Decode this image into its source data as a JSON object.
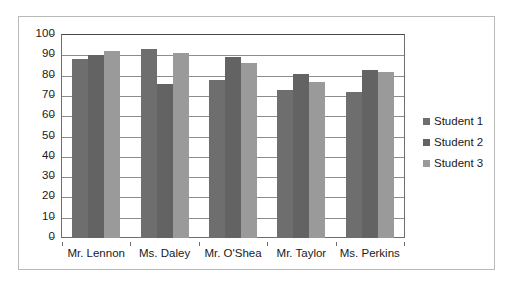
{
  "chart_data": {
    "type": "bar",
    "title": "",
    "subtitle": "",
    "xlabel": "",
    "ylabel": "",
    "categories": [
      "Mr. Lennon",
      "Ms. Daley",
      "Mr. O'Shea",
      "Mr. Taylor",
      "Ms. Perkins"
    ],
    "series": [
      {
        "name": "Student 1",
        "color": "#6e6e6e",
        "values": [
          88,
          93,
          78,
          73,
          72
        ]
      },
      {
        "name": "Student 2",
        "color": "#636363",
        "values": [
          90,
          76,
          89,
          81,
          83
        ]
      },
      {
        "name": "Student 3",
        "color": "#9a9a9a",
        "values": [
          92,
          91,
          86,
          77,
          82
        ]
      }
    ],
    "ylim": [
      0,
      100
    ],
    "ytick_step": 10,
    "ytick_labels": [
      "100",
      "90",
      "80",
      "70",
      "60",
      "50",
      "40",
      "30",
      "20",
      "10",
      "0"
    ],
    "grid": true,
    "grid_axis": "y",
    "legend_position": "right",
    "plot_background": "#ffffff",
    "gridline_color": "#8c8c8c",
    "axis_color": "#6e6e6e",
    "border_color": "#b9b9b9",
    "text_color": "#1a1a1a"
  }
}
